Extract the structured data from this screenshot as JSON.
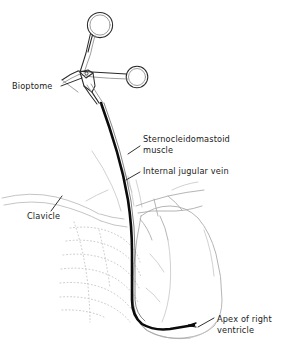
{
  "figure": {
    "width": 294,
    "height": 348,
    "background_color": "#ffffff"
  },
  "colors": {
    "catheter": "#0b0b0b",
    "instrument": "#2a2a2a",
    "instrument_highlight": "#8d8d8d",
    "anatomy_outline": "#a8a8a8",
    "anatomy_faint": "#c2c2c2",
    "rib_dotted": "#bdbdbd",
    "label_text": "#1a1a1a",
    "leader_line": "#1a1a1a"
  },
  "labels": [
    {
      "id": "bioptome",
      "name": "Bioptome",
      "lines": [
        "Bioptome"
      ],
      "x": 12,
      "y": 89,
      "anchor": "start"
    },
    {
      "id": "sternocleidomastoid",
      "name": "Sternocleidomastoid muscle",
      "lines": [
        "Sternocleidomastoid",
        "muscle"
      ],
      "x": 143,
      "y": 142,
      "anchor": "start"
    },
    {
      "id": "internal-jugular-vein",
      "name": "Internal jugular vein",
      "lines": [
        "Internal jugular vein"
      ],
      "x": 143,
      "y": 174,
      "anchor": "start"
    },
    {
      "id": "clavicle",
      "name": "Clavicle",
      "lines": [
        "Clavicle"
      ],
      "x": 27,
      "y": 219,
      "anchor": "start"
    },
    {
      "id": "apex-right-ventricle",
      "name": "Apex of right ventricle",
      "lines": [
        "Apex of right",
        "ventricle"
      ],
      "x": 217,
      "y": 322,
      "anchor": "start"
    }
  ],
  "structures": {
    "instrument_label": "bioptome-forceps",
    "ring_upper_label": "finger-ring-upper",
    "ring_lower_label": "finger-ring-lower",
    "hinge_label": "forceps-hinge",
    "shaft_label": "forceps-shaft",
    "catheter_label": "catheter-path",
    "catheter_tip_label": "catheter-tip",
    "heart_label": "heart-outline",
    "ribcage_label": "ribcage-dotted",
    "clavicle_label": "clavicle-bone",
    "vessels_label": "great-vessels",
    "scm_label": "sternocleidomastoid-muscle",
    "ijv_label": "internal-jugular-vein-outline"
  }
}
